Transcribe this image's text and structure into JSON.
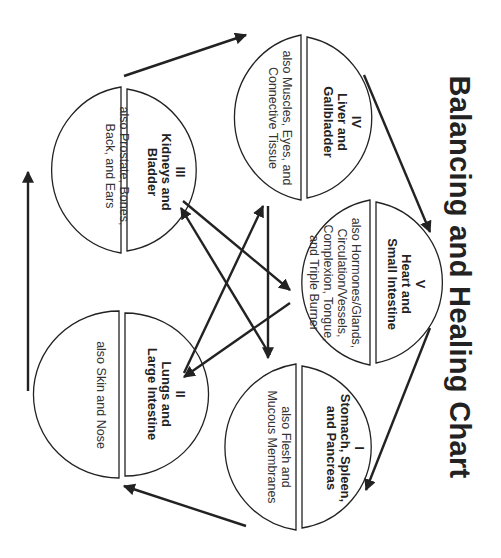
{
  "title": "Balancing and Healing Chart",
  "elements": {
    "stomach": {
      "numeral": "I",
      "name": "Stomach, Spleen, and Pancreas",
      "name_line1": "Stomach, Spleen,",
      "name_line2": "and Pancreas",
      "also": "also Flesh and Mucous Membranes",
      "also_line1": "also Flesh and",
      "also_line2": "Mucous Membranes"
    },
    "lungs": {
      "numeral": "II",
      "name": "Lungs and Large Intestine",
      "name_line1": "Lungs and",
      "name_line2": "Large Intestine",
      "also": "also Skin and Nose",
      "also_line1": "also Skin and Nose"
    },
    "kidneys": {
      "numeral": "III",
      "name": "Kidneys and Bladder",
      "name_line1": "Kidneys and",
      "name_line2": "Bladder",
      "also": "also Prostate, Bones, Back, and Ears",
      "also_line1": "also Prostate, Bones,",
      "also_line2": "Back, and Ears"
    },
    "liver": {
      "numeral": "IV",
      "name": "Liver and Gallbladder",
      "name_line1": "Liver and",
      "name_line2": "Gallbladder",
      "also": "also Muscles, Eyes, and Connective Tissue",
      "also_line1": "also Muscles, Eyes, and",
      "also_line2": "Connective Tissue"
    },
    "heart": {
      "numeral": "V",
      "name": "Heart and Small Intestine",
      "name_line1": "Heart and",
      "name_line2": "Small Intestine",
      "also": "also Hormones/Glands, Circulation/Vessels, Complexion, Tongue, and Triple Burner",
      "also_line1": "also Hormones/Glands,",
      "also_line2": "Circulation/Vessels,",
      "also_line3": "Complexion, Tongue,",
      "also_line4": "and Triple Burner"
    }
  },
  "cycle_arrows": [
    {
      "from": "heart",
      "to": "stomach"
    },
    {
      "from": "stomach",
      "to": "lungs"
    },
    {
      "from": "lungs",
      "to": "kidneys"
    },
    {
      "from": "kidneys",
      "to": "liver"
    },
    {
      "from": "liver",
      "to": "heart"
    }
  ],
  "control_arrows": [
    {
      "from": "kidneys",
      "to": "heart"
    },
    {
      "from": "heart",
      "to": "lungs"
    },
    {
      "from": "lungs",
      "to": "liver"
    },
    {
      "from": "liver",
      "to": "stomach"
    },
    {
      "from": "stomach",
      "to": "kidneys"
    }
  ],
  "colors": {
    "line": "#222222",
    "background": "#ffffff"
  }
}
